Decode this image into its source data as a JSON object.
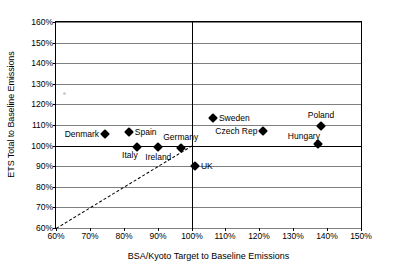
{
  "chart_data": {
    "type": "scatter",
    "title": "",
    "xlabel": "BSA/Kyoto Target to Baseline Emissions",
    "ylabel": "ETS Total to Baseline Emissions",
    "xlim": [
      60,
      150
    ],
    "ylim": [
      60,
      160
    ],
    "x_tick_step": 10,
    "y_tick_step": 10,
    "x_ticks": [
      "60%",
      "70%",
      "80%",
      "90%",
      "100%",
      "110%",
      "120%",
      "130%",
      "140%",
      "150%"
    ],
    "y_ticks": [
      "60%",
      "70%",
      "80%",
      "90%",
      "100%",
      "110%",
      "120%",
      "130%",
      "140%",
      "150%",
      "160%"
    ],
    "grid": "horizontal",
    "legend": "none",
    "emphasis_lines": {
      "horizontal_value": 100,
      "vertical_value": 100
    },
    "reference_line": {
      "label": "parity line",
      "style": "dashed",
      "from": [
        60,
        60
      ],
      "to": [
        100,
        100
      ]
    },
    "points": [
      {
        "name": "Denmark",
        "x": 74.5,
        "y": 105.5,
        "label_position": "left"
      },
      {
        "name": "Spain",
        "x": 81.5,
        "y": 106.5,
        "label_position": "right"
      },
      {
        "name": "Italy",
        "x": 83.8,
        "y": 99.4,
        "label_position": "below-left"
      },
      {
        "name": "Ireland",
        "x": 90.2,
        "y": 99.3,
        "label_position": "below"
      },
      {
        "name": "Germany",
        "x": 96.8,
        "y": 98.6,
        "label_position": "above"
      },
      {
        "name": "UK",
        "x": 101.0,
        "y": 90.3,
        "label_position": "right"
      },
      {
        "name": "Sweden",
        "x": 106.3,
        "y": 113.3,
        "label_position": "right"
      },
      {
        "name": "Czech Rep",
        "x": 121.2,
        "y": 107.2,
        "label_position": "left"
      },
      {
        "name": "Hungary",
        "x": 137.3,
        "y": 100.8,
        "label_position": "above-left"
      },
      {
        "name": "Poland",
        "x": 138.2,
        "y": 109.5,
        "label_position": "above"
      }
    ]
  }
}
